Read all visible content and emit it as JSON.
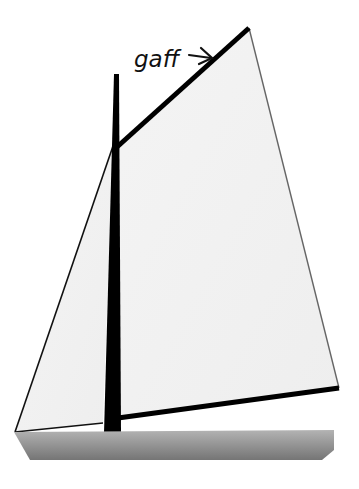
{
  "diagram": {
    "labels": {
      "gaff": "gaff"
    },
    "parts": [
      "mast",
      "gaff",
      "mainsail",
      "jib",
      "boom",
      "hull"
    ],
    "colors": {
      "sail": "#f2f2f2",
      "spar": "#000000",
      "hull_top": "#b0b0b0",
      "hull_bottom": "#7a7a7a",
      "background": "#ffffff"
    }
  }
}
